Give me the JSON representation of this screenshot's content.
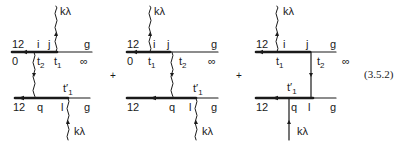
{
  "equation_number": "(3.5.2)",
  "operator": "+",
  "photon_label": "kλ",
  "diagrams": [
    {
      "top": {
        "left": "12",
        "mid1": "i",
        "mid2": "j",
        "right": "g",
        "below_left": "0",
        "below_right": "∞"
      },
      "times": {
        "a": "t",
        "a_sub": "2",
        "b": "t",
        "b_sub": "1",
        "c": "t",
        "c_sub": "1",
        "c_prime": "′"
      },
      "bottom": {
        "left": "12",
        "mid1": "q",
        "mid2": "l",
        "right": "g"
      }
    },
    {
      "top": {
        "left": "12",
        "mid1": "i",
        "mid2": "j",
        "right": "g",
        "below_left": "0",
        "below_right": "∞"
      },
      "times": {
        "a": "t",
        "a_sub": "1",
        "b": "t",
        "b_sub": "2",
        "c": "t",
        "c_sub": "1",
        "c_prime": "′"
      },
      "bottom": {
        "left": "12",
        "mid1": "q",
        "mid2": "l",
        "right": "g"
      }
    },
    {
      "top": {
        "left": "12",
        "mid1": "i",
        "mid2": "j",
        "right": "g",
        "below_left": "0",
        "below_right": "∞"
      },
      "times": {
        "a": "t",
        "a_sub": "1",
        "b": "t",
        "b_sub": "2",
        "c": "t",
        "c_sub": "1",
        "c_prime": "′"
      },
      "bottom": {
        "left": "12",
        "mid1": "q",
        "mid2": "l",
        "right": "g"
      }
    }
  ]
}
